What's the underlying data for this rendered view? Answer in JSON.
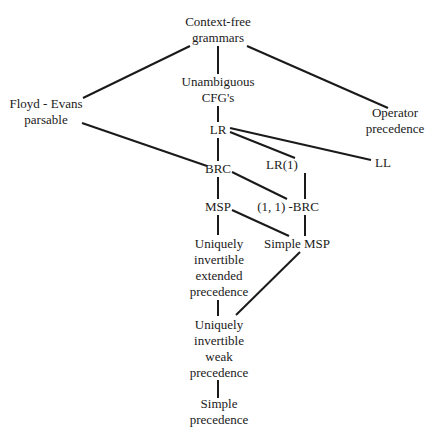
{
  "diagram": {
    "type": "hierarchy",
    "colors": {
      "line": "#1a1a1a",
      "text": "#1a1a1a",
      "background": "#ffffff"
    },
    "nodes": {
      "cfg": {
        "lines": [
          "Context-free",
          "grammars"
        ],
        "x": 218,
        "y": 30
      },
      "unamb": {
        "lines": [
          "Unambiguous",
          "CFG's"
        ],
        "x": 218,
        "y": 90
      },
      "floyd": {
        "lines": [
          "Floyd - Evans",
          "parsable"
        ],
        "x": 46,
        "y": 112
      },
      "opprec": {
        "lines": [
          "Operator",
          "precedence"
        ],
        "x": 395,
        "y": 121
      },
      "lr": {
        "lines": [
          "LR"
        ],
        "x": 218,
        "y": 130
      },
      "lr1": {
        "lines": [
          "LR(1)"
        ],
        "x": 282,
        "y": 165
      },
      "ll": {
        "lines": [
          "LL"
        ],
        "x": 383,
        "y": 163
      },
      "brc": {
        "lines": [
          "BRC"
        ],
        "x": 218,
        "y": 169
      },
      "brc11": {
        "lines": [
          "(1, 1) -BRC"
        ],
        "x": 288,
        "y": 207
      },
      "msp": {
        "lines": [
          "MSP"
        ],
        "x": 218,
        "y": 207
      },
      "smsp": {
        "lines": [
          "Simple MSP"
        ],
        "x": 297,
        "y": 244
      },
      "uiep": {
        "lines": [
          "Uniquely",
          "invertible",
          "extended",
          "precedence"
        ],
        "x": 219,
        "y": 268
      },
      "uiwp": {
        "lines": [
          "Uniquely",
          "invertible",
          "weak",
          "precedence"
        ],
        "x": 219,
        "y": 349
      },
      "sp": {
        "lines": [
          "Simple",
          "precedence"
        ],
        "x": 219,
        "y": 412
      }
    },
    "edges": [
      {
        "from": "cfg",
        "to": "floyd",
        "x1": 190,
        "y1": 46,
        "x2": 83,
        "y2": 98
      },
      {
        "from": "cfg",
        "to": "unamb",
        "x1": 218,
        "y1": 46,
        "x2": 218,
        "y2": 74
      },
      {
        "from": "cfg",
        "to": "opprec",
        "x1": 247,
        "y1": 46,
        "x2": 388,
        "y2": 108
      },
      {
        "from": "unamb",
        "to": "lr",
        "x1": 218,
        "y1": 106,
        "x2": 218,
        "y2": 122
      },
      {
        "from": "floyd",
        "to": "brc",
        "x1": 82,
        "y1": 123,
        "x2": 207,
        "y2": 166
      },
      {
        "from": "lr",
        "to": "ll",
        "x1": 230,
        "y1": 128,
        "x2": 371,
        "y2": 160
      },
      {
        "from": "lr",
        "to": "lr1",
        "x1": 230,
        "y1": 132,
        "x2": 295,
        "y2": 158
      },
      {
        "from": "lr",
        "to": "brc",
        "x1": 218,
        "y1": 138,
        "x2": 218,
        "y2": 161
      },
      {
        "from": "lr1",
        "to": "brc11",
        "x1": 305,
        "y1": 173,
        "x2": 305,
        "y2": 199
      },
      {
        "from": "brc",
        "to": "brc11",
        "x1": 232,
        "y1": 172,
        "x2": 287,
        "y2": 199
      },
      {
        "from": "brc",
        "to": "msp",
        "x1": 218,
        "y1": 177,
        "x2": 218,
        "y2": 199
      },
      {
        "from": "brc11",
        "to": "smsp",
        "x1": 305,
        "y1": 215,
        "x2": 305,
        "y2": 236
      },
      {
        "from": "msp",
        "to": "smsp",
        "x1": 232,
        "y1": 210,
        "x2": 289,
        "y2": 236
      },
      {
        "from": "msp",
        "to": "uiep",
        "x1": 218,
        "y1": 215,
        "x2": 218,
        "y2": 235
      },
      {
        "from": "smsp",
        "to": "uiwp",
        "x1": 300,
        "y1": 252,
        "x2": 236,
        "y2": 315
      },
      {
        "from": "uiep",
        "to": "uiwp",
        "x1": 218,
        "y1": 300,
        "x2": 218,
        "y2": 316
      },
      {
        "from": "uiwp",
        "to": "sp",
        "x1": 218,
        "y1": 380,
        "x2": 218,
        "y2": 398
      }
    ]
  }
}
